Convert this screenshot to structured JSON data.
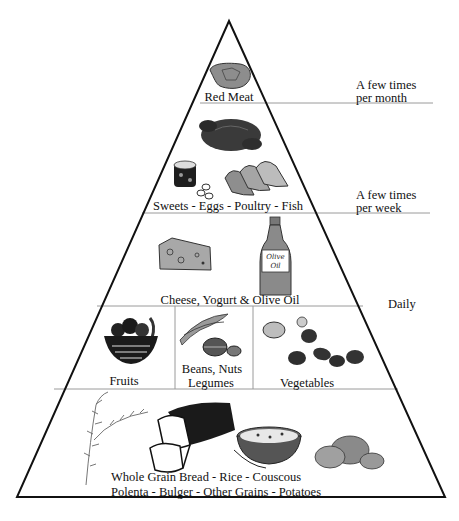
{
  "diagram": {
    "type": "food-pyramid",
    "tiers": [
      {
        "id": "red-meat",
        "label": "Red Meat",
        "frequency": "A few times per month"
      },
      {
        "id": "weekly",
        "label": "Sweets - Eggs - Poultry - Fish",
        "frequency": "A few times per week"
      },
      {
        "id": "dairy-oil",
        "label": "Cheese, Yogurt & Olive Oil",
        "frequency": "Daily"
      },
      {
        "id": "plants",
        "sections": [
          {
            "label": "Fruits"
          },
          {
            "label_line1": "Beans, Nuts",
            "label_line2": "Legumes"
          },
          {
            "label": "Vegetables"
          }
        ]
      },
      {
        "id": "grains",
        "label_line1": "Whole Grain Bread - Rice - Couscous",
        "label_line2": "Polenta - Bulger - Other Grains - Potatoes"
      }
    ],
    "frequencies": {
      "monthly_line1": "A few times",
      "monthly_line2": "per month",
      "weekly_line1": "A few times",
      "weekly_line2": "per week",
      "daily": "Daily"
    },
    "bottle_text_line1": "Olive",
    "bottle_text_line2": "Oil",
    "icons": [
      "steak-icon",
      "roast-chicken-icon",
      "sweets-icon",
      "eggs-icon",
      "fish-steaks-icon",
      "cheese-icon",
      "olive-oil-bottle-icon",
      "fruit-bowl-icon",
      "bean-pods-icon",
      "nuts-icon",
      "vegetables-icon",
      "wheat-stalk-icon",
      "bread-loaf-icon",
      "grain-bowl-icon",
      "potatoes-icon"
    ],
    "colors": {
      "line": "#111111",
      "divider": "#9a9a9a",
      "fill_dark": "#2e2e2e",
      "fill_mid": "#6e6e6e",
      "fill_light": "#b5b5b5"
    }
  }
}
